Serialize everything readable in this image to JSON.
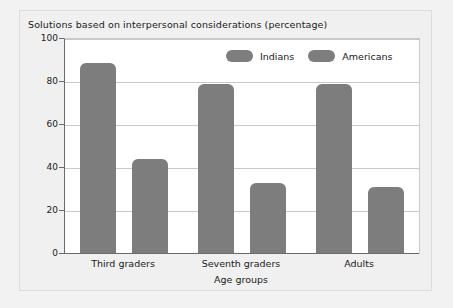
{
  "chart_data": {
    "type": "bar",
    "title": "Solutions based on interpersonal considerations (percentage)",
    "xlabel": "Age groups",
    "ylabel": "",
    "categories": [
      "Third graders",
      "Seventh graders",
      "Adults"
    ],
    "series": [
      {
        "name": "Indians",
        "values": [
          89,
          79,
          79
        ],
        "color": "#7d7d7d"
      },
      {
        "name": "Americans",
        "values": [
          44,
          33,
          31
        ],
        "color": "#7d7d7d"
      }
    ],
    "ylim": [
      0,
      100
    ],
    "yticks": [
      0,
      20,
      40,
      60,
      80,
      100
    ],
    "ytick_labels": [
      "0",
      "20",
      "40",
      "60",
      "80",
      "100"
    ],
    "grid": true,
    "legend_position": "top-right"
  },
  "colors": {
    "bar": "#7d7d7d",
    "gridline": "#c9c9c9",
    "axis": "#6b6b6b",
    "plot_background": "#ffffff",
    "panel_background": "#f0f0f0",
    "text": "#1a1a1a"
  }
}
